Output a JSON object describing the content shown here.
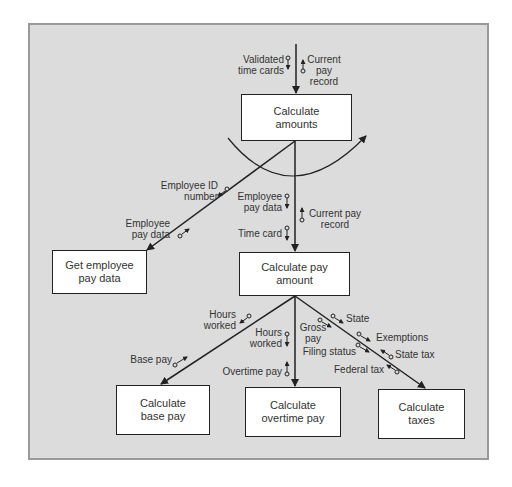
{
  "modules": {
    "calculate_amounts": "Calculate\namounts",
    "get_employee_pay_data": "Get employee\npay data",
    "calculate_pay_amount": "Calculate pay\namount",
    "calculate_base_pay": "Calculate\nbase pay",
    "calculate_overtime_pay": "Calculate\novertime pay",
    "calculate_taxes": "Calculate\ntaxes"
  },
  "couples": {
    "validated_time_cards": "Validated\ntime cards",
    "current_pay_record_top": "Current\npay\nrecord",
    "employee_id_number": "Employee ID\nnumber",
    "employee_pay_data_left": "Employee\npay data",
    "employee_pay_data_mid": "Employee\npay data",
    "current_pay_record_mid": "Current pay\nrecord",
    "time_card": "Time card",
    "hours_worked_left": "Hours\nworked",
    "base_pay": "Base pay",
    "hours_worked_mid": "Hours\nworked",
    "overtime_pay": "Overtime pay",
    "gross_pay": "Gross\npay",
    "state": "State",
    "exemptions": "Exemptions",
    "filing_status": "Filing status",
    "state_tax": "State tax",
    "federal_tax": "Federal tax"
  },
  "loop_symbol": "iteration-loop-arc"
}
